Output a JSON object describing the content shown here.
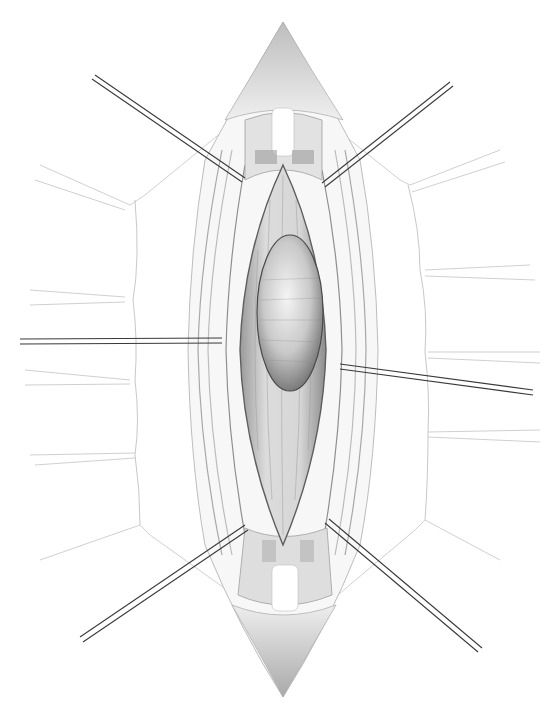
{
  "figure": {
    "title": "",
    "type": "surgical-illustration",
    "width": 552,
    "height": 708,
    "colors": {
      "background": "#ffffff",
      "line": "#555555",
      "retractor": "#3a3a3a",
      "shade_light": "#e8e8e8",
      "shade_mid": "#c4c4c4",
      "shade_dark": "#8a8a8a"
    },
    "retractors": [
      {
        "name": "upper-left",
        "x1": 95,
        "y1": 75,
        "x2": 245,
        "y2": 178
      },
      {
        "name": "upper-right",
        "x1": 450,
        "y1": 82,
        "x2": 322,
        "y2": 183
      },
      {
        "name": "mid-left",
        "x1": 20,
        "y1": 343,
        "x2": 222,
        "y2": 340
      },
      {
        "name": "mid-right",
        "x1": 533,
        "y1": 393,
        "x2": 340,
        "y2": 366
      },
      {
        "name": "lower-left",
        "x1": 82,
        "y1": 640,
        "x2": 245,
        "y2": 528
      },
      {
        "name": "lower-right",
        "x1": 480,
        "y1": 650,
        "x2": 327,
        "y2": 525
      }
    ],
    "mass": {
      "cx": 290,
      "cy": 313,
      "rx": 33,
      "ry": 78
    },
    "incision": {
      "top_apex_y": 22,
      "bottom_apex_y": 697,
      "center_x": 283
    }
  }
}
